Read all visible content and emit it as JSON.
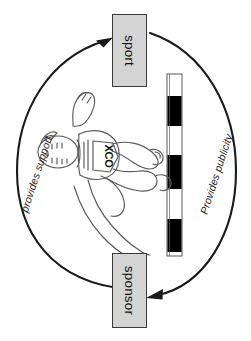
{
  "diagram": {
    "type": "cycle-diagram",
    "background_color": "#ffffff",
    "nodes": [
      {
        "id": "sport",
        "label": "sport",
        "fill": "#d4d4d4",
        "stroke": "#3a3a3a",
        "rotation_deg": 90
      },
      {
        "id": "sponsor",
        "label": "sponsor",
        "fill": "#d4d4d4",
        "stroke": "#3a3a3a",
        "rotation_deg": 90
      }
    ],
    "arrows": [
      {
        "id": "left-arc",
        "label": "provides support",
        "from": "sponsor",
        "to": "sport",
        "side": "left",
        "italic": true
      },
      {
        "id": "right-arc",
        "label": "Provides publicity",
        "from": "sport",
        "to": "sponsor",
        "side": "right",
        "italic": true
      }
    ],
    "illustration": {
      "subject": "high-jump-athlete",
      "jersey_text": "XCO",
      "crossbar": {
        "orientation": "vertical",
        "segment_colors": [
          "#ffffff",
          "#000000",
          "#ffffff",
          "#000000",
          "#ffffff",
          "#000000"
        ]
      },
      "line_color": "#555555"
    }
  }
}
